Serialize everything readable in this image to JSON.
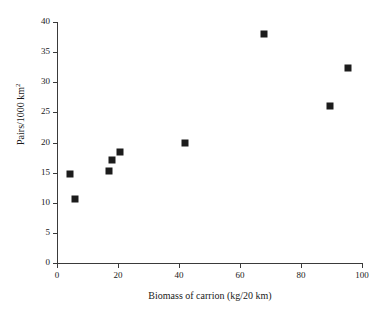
{
  "chart_data": {
    "type": "scatter",
    "title": "",
    "xlabel": "Biomass of carrion (kg/20 km)",
    "ylabel": "Pairs/1000 km2",
    "ylabel_base": "Pairs/1000 km",
    "ylabel_exponent": "2",
    "xlim": [
      0,
      100
    ],
    "ylim": [
      0,
      40
    ],
    "xticks": [
      0,
      20,
      40,
      60,
      80,
      100
    ],
    "yticks": [
      0,
      5,
      10,
      15,
      20,
      25,
      30,
      35,
      40
    ],
    "xtick_labels": [
      "0",
      "20",
      "40",
      "60",
      "80",
      "100"
    ],
    "ytick_labels": [
      "0",
      "5",
      "10",
      "15",
      "20",
      "25",
      "30",
      "35",
      "40"
    ],
    "grid": false,
    "legend": false,
    "marker": "filled-square",
    "marker_color": "#1c1c1c",
    "points": [
      {
        "x": 4.3,
        "y": 14.7
      },
      {
        "x": 6.0,
        "y": 10.7
      },
      {
        "x": 17.0,
        "y": 15.2
      },
      {
        "x": 18.0,
        "y": 17.1
      },
      {
        "x": 20.5,
        "y": 18.4
      },
      {
        "x": 42.0,
        "y": 19.9
      },
      {
        "x": 68.0,
        "y": 38.0
      },
      {
        "x": 89.5,
        "y": 26.1
      },
      {
        "x": 95.5,
        "y": 32.4
      }
    ]
  }
}
